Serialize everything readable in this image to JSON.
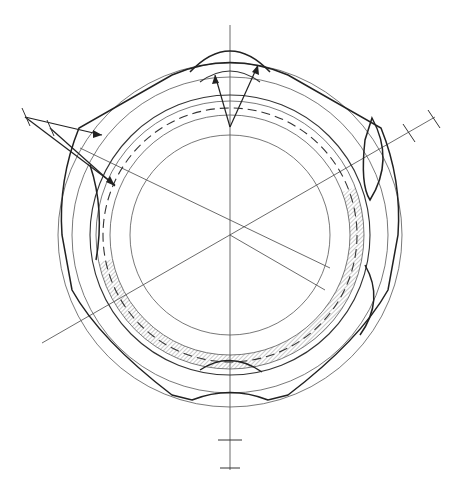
{
  "drawing": {
    "type": "technical-engineering-drawing",
    "subject": "hexagonal nut / ring cross-section, top view",
    "labels": [],
    "colors": {
      "background": "#ffffff",
      "line": "#222222",
      "hatch": "#666666"
    },
    "geometry": {
      "center": [
        230,
        235
      ],
      "circles_r": [
        172,
        158,
        140,
        134,
        126,
        118,
        100
      ],
      "dashed_circle_r": 130,
      "hex_circumradius": 185,
      "centerline_angles_deg": [
        90,
        30,
        150
      ],
      "hatched_sector": "lower-right band from approx 200° to 340° clockwise"
    }
  }
}
